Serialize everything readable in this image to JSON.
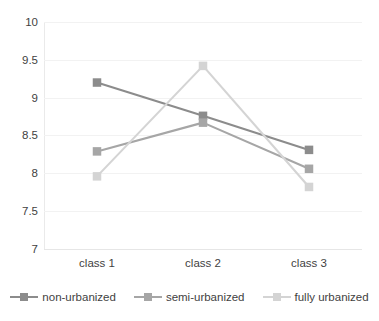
{
  "chart_data": {
    "type": "line",
    "title": "",
    "subtitle": "",
    "xlabel": "",
    "ylabel": "",
    "categories": [
      "class 1",
      "class 2",
      "class 3"
    ],
    "series": [
      {
        "name": "non-urbanized",
        "color": "#8c8c8c",
        "values": [
          9.2,
          8.76,
          8.31
        ]
      },
      {
        "name": "semi-urbanized",
        "color": "#a6a6a6",
        "values": [
          8.29,
          8.67,
          8.06
        ]
      },
      {
        "name": "fully urbanized",
        "color": "#d4d4d4",
        "values": [
          7.96,
          9.42,
          7.82
        ]
      }
    ],
    "ylim": [
      7,
      10
    ],
    "yticks": [
      "10",
      "9.5",
      "9",
      "8.5",
      "8",
      "7.5",
      "7"
    ],
    "ytick_values": [
      10,
      9.5,
      9,
      8.5,
      8,
      7.5,
      7
    ],
    "xticks": [
      "class 1",
      "class 2",
      "class 3"
    ],
    "grid": true,
    "grid_axis": "y",
    "legend_position": "bottom",
    "marker": "square",
    "background": "#ffffff",
    "gridline_color": "#f2f2f2",
    "axis_color": "#e6e6e6",
    "text_color": "#3f3f3f"
  },
  "legend": {
    "items": [
      {
        "label": "non-urbanized"
      },
      {
        "label": "semi-urbanized"
      },
      {
        "label": "fully urbanized"
      }
    ]
  }
}
